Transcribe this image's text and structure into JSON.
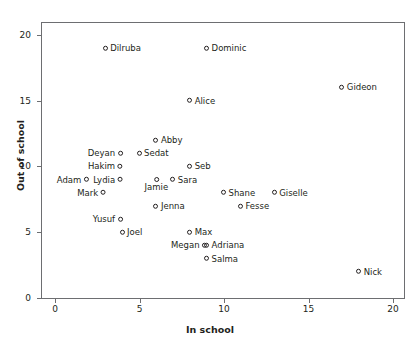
{
  "chart_data": {
    "type": "scatter",
    "title": "",
    "xlabel": "In school",
    "ylabel": "Out of school",
    "xlim": [
      -1.2,
      21.5
    ],
    "ylim": [
      0,
      21.8
    ],
    "xticks": [
      0,
      5,
      10,
      15,
      20
    ],
    "yticks": [
      0,
      5,
      10,
      15,
      20
    ],
    "grid": false,
    "legend": null,
    "marker_style": "open-circle",
    "points": [
      {
        "label": "Dilruba",
        "x": 3,
        "y": 19,
        "label_side": "right"
      },
      {
        "label": "Dominic",
        "x": 9,
        "y": 19,
        "label_side": "right"
      },
      {
        "label": "Gideon",
        "x": 17,
        "y": 16,
        "label_side": "right"
      },
      {
        "label": "Alice",
        "x": 8,
        "y": 15,
        "label_side": "right"
      },
      {
        "label": "Abby",
        "x": 6,
        "y": 12,
        "label_side": "right"
      },
      {
        "label": "Deyan",
        "x": 4,
        "y": 11,
        "label_side": "left"
      },
      {
        "label": "Sedat",
        "x": 5,
        "y": 11,
        "label_side": "right"
      },
      {
        "label": "Hakim",
        "x": 4,
        "y": 10,
        "label_side": "left"
      },
      {
        "label": "Seb",
        "x": 8,
        "y": 10,
        "label_side": "right"
      },
      {
        "label": "Adam",
        "x": 2,
        "y": 9,
        "label_side": "left"
      },
      {
        "label": "Lydia",
        "x": 4,
        "y": 9,
        "label_side": "left"
      },
      {
        "label": "Jamie",
        "x": 6,
        "y": 9,
        "label_side": "below"
      },
      {
        "label": "Sara",
        "x": 7,
        "y": 9,
        "label_side": "right"
      },
      {
        "label": "Mark",
        "x": 3,
        "y": 8,
        "label_side": "left"
      },
      {
        "label": "Shane",
        "x": 10,
        "y": 8,
        "label_side": "right"
      },
      {
        "label": "Giselle",
        "x": 13,
        "y": 8,
        "label_side": "right"
      },
      {
        "label": "Jenna",
        "x": 6,
        "y": 7,
        "label_side": "right"
      },
      {
        "label": "Fesse",
        "x": 11,
        "y": 7,
        "label_side": "right"
      },
      {
        "label": "Yusuf",
        "x": 4,
        "y": 6,
        "label_side": "left"
      },
      {
        "label": "Joel",
        "x": 4,
        "y": 5,
        "label_side": "right"
      },
      {
        "label": "Max",
        "x": 8,
        "y": 5,
        "label_side": "right"
      },
      {
        "label": "Megan",
        "x": 9,
        "y": 4,
        "label_side": "left"
      },
      {
        "label": "Adriana",
        "x": 9,
        "y": 4,
        "label_side": "right"
      },
      {
        "label": "Salma",
        "x": 9,
        "y": 3,
        "label_side": "right"
      },
      {
        "label": "Nick",
        "x": 18,
        "y": 2,
        "label_side": "right"
      }
    ],
    "colors": {
      "marker_stroke": "#231f20",
      "axis": "#6d6e71",
      "text": "#231f20",
      "background": "#ffffff"
    }
  }
}
